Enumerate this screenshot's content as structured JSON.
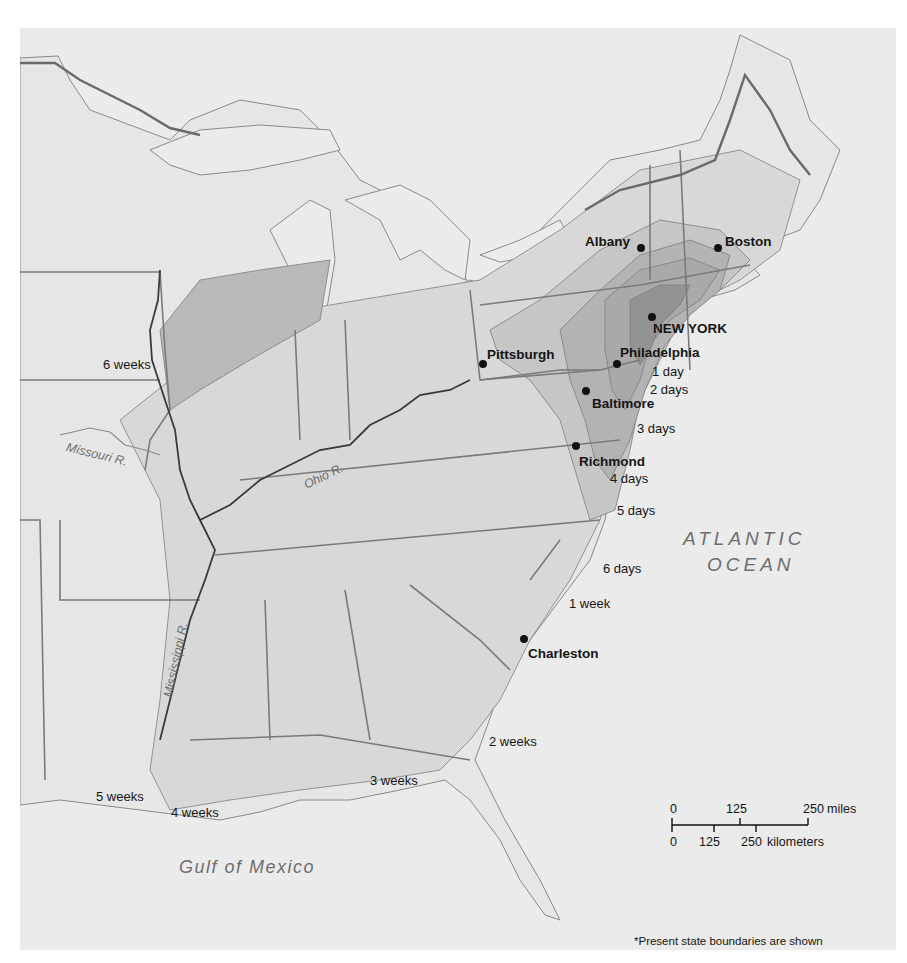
{
  "map": {
    "colors": {
      "sea": "#ebebeb",
      "land_unshaded": "#e6e6e6",
      "band_6wk": "#b9b9b9",
      "band_light": "#d8d8d8",
      "band_mid": "#c6c6c6",
      "band_dark": "#a9a9a9",
      "band_darkest": "#939393",
      "border": "#7a7a7a",
      "river_major": "#3a3a3a",
      "text": "#151515",
      "water_text": "#6e6e6e"
    },
    "cities": [
      {
        "name": "Albany",
        "label": "Albany"
      },
      {
        "name": "Boston",
        "label": "Boston"
      },
      {
        "name": "New York",
        "label": "NEW YORK"
      },
      {
        "name": "Pittsburgh",
        "label": "Pittsburgh"
      },
      {
        "name": "Philadelphia",
        "label": "Philadelphia"
      },
      {
        "name": "Baltimore",
        "label": "Baltimore"
      },
      {
        "name": "Richmond",
        "label": "Richmond"
      },
      {
        "name": "Charleston",
        "label": "Charleston"
      }
    ],
    "contour_labels": [
      "1 day",
      "2 days",
      "3 days",
      "4 days",
      "5 days",
      "6 days",
      "1 week",
      "2 weeks",
      "3 weeks",
      "4 weeks",
      "5 weeks",
      "6 weeks"
    ],
    "water_labels": {
      "atlantic_line1": "ATLANTIC",
      "atlantic_line2": "OCEAN",
      "gulf": "Gulf of Mexico"
    },
    "rivers": {
      "missouri": "Missouri R.",
      "ohio": "Ohio R.",
      "mississippi": "Mississippi R."
    },
    "scale_bar": {
      "miles": {
        "ticks": [
          "0",
          "125",
          "250"
        ],
        "unit": "miles"
      },
      "kilometers": {
        "ticks": [
          "0",
          "125",
          "250"
        ],
        "unit": "kilometers"
      }
    },
    "footnote": "*Present state boundaries are shown"
  }
}
